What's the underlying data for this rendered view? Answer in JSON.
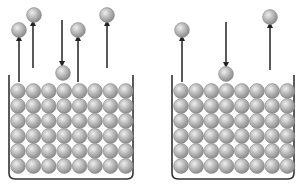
{
  "diagram": {
    "colors": {
      "background": "#ffffff",
      "stroke": "#333333",
      "sphere_light": "#e6e6e6",
      "sphere_mid": "#b4b4b4",
      "sphere_dark": "#8a8a8a"
    },
    "containers": [
      {
        "id": "left",
        "x": 9,
        "y": 75,
        "width": 124,
        "height": 104,
        "grid": {
          "cols": 8,
          "rows": 6,
          "x0": 18,
          "y0": 91,
          "dx": 15.4,
          "dy": 15
        },
        "vapor_particles": [
          {
            "x": 19,
            "y": 30,
            "direction": "up",
            "arrow_x": 19,
            "arrow_from": 82,
            "arrow_to": 38
          },
          {
            "x": 34,
            "y": 15,
            "direction": "up",
            "arrow_x": 33,
            "arrow_from": 68,
            "arrow_to": 23
          },
          {
            "x": 63,
            "y": 73,
            "direction": "down",
            "arrow_x": 62,
            "arrow_from": 20,
            "arrow_to": 64
          },
          {
            "x": 78,
            "y": 30,
            "direction": "up",
            "arrow_x": 78,
            "arrow_from": 82,
            "arrow_to": 38
          },
          {
            "x": 107,
            "y": 15,
            "direction": "up",
            "arrow_x": 107,
            "arrow_from": 68,
            "arrow_to": 23
          }
        ]
      },
      {
        "id": "right",
        "x": 172,
        "y": 75,
        "width": 122,
        "height": 104,
        "grid": {
          "cols": 8,
          "rows": 6,
          "x0": 181,
          "y0": 91,
          "dx": 15.2,
          "dy": 15
        },
        "vapor_particles": [
          {
            "x": 182,
            "y": 30,
            "direction": "up",
            "arrow_x": 182,
            "arrow_from": 82,
            "arrow_to": 38
          },
          {
            "x": 226,
            "y": 74,
            "direction": "down",
            "arrow_x": 226,
            "arrow_from": 22,
            "arrow_to": 65
          },
          {
            "x": 270,
            "y": 17,
            "direction": "up",
            "arrow_x": 270,
            "arrow_from": 70,
            "arrow_to": 25
          }
        ]
      }
    ],
    "particle_radius": 7.4
  }
}
